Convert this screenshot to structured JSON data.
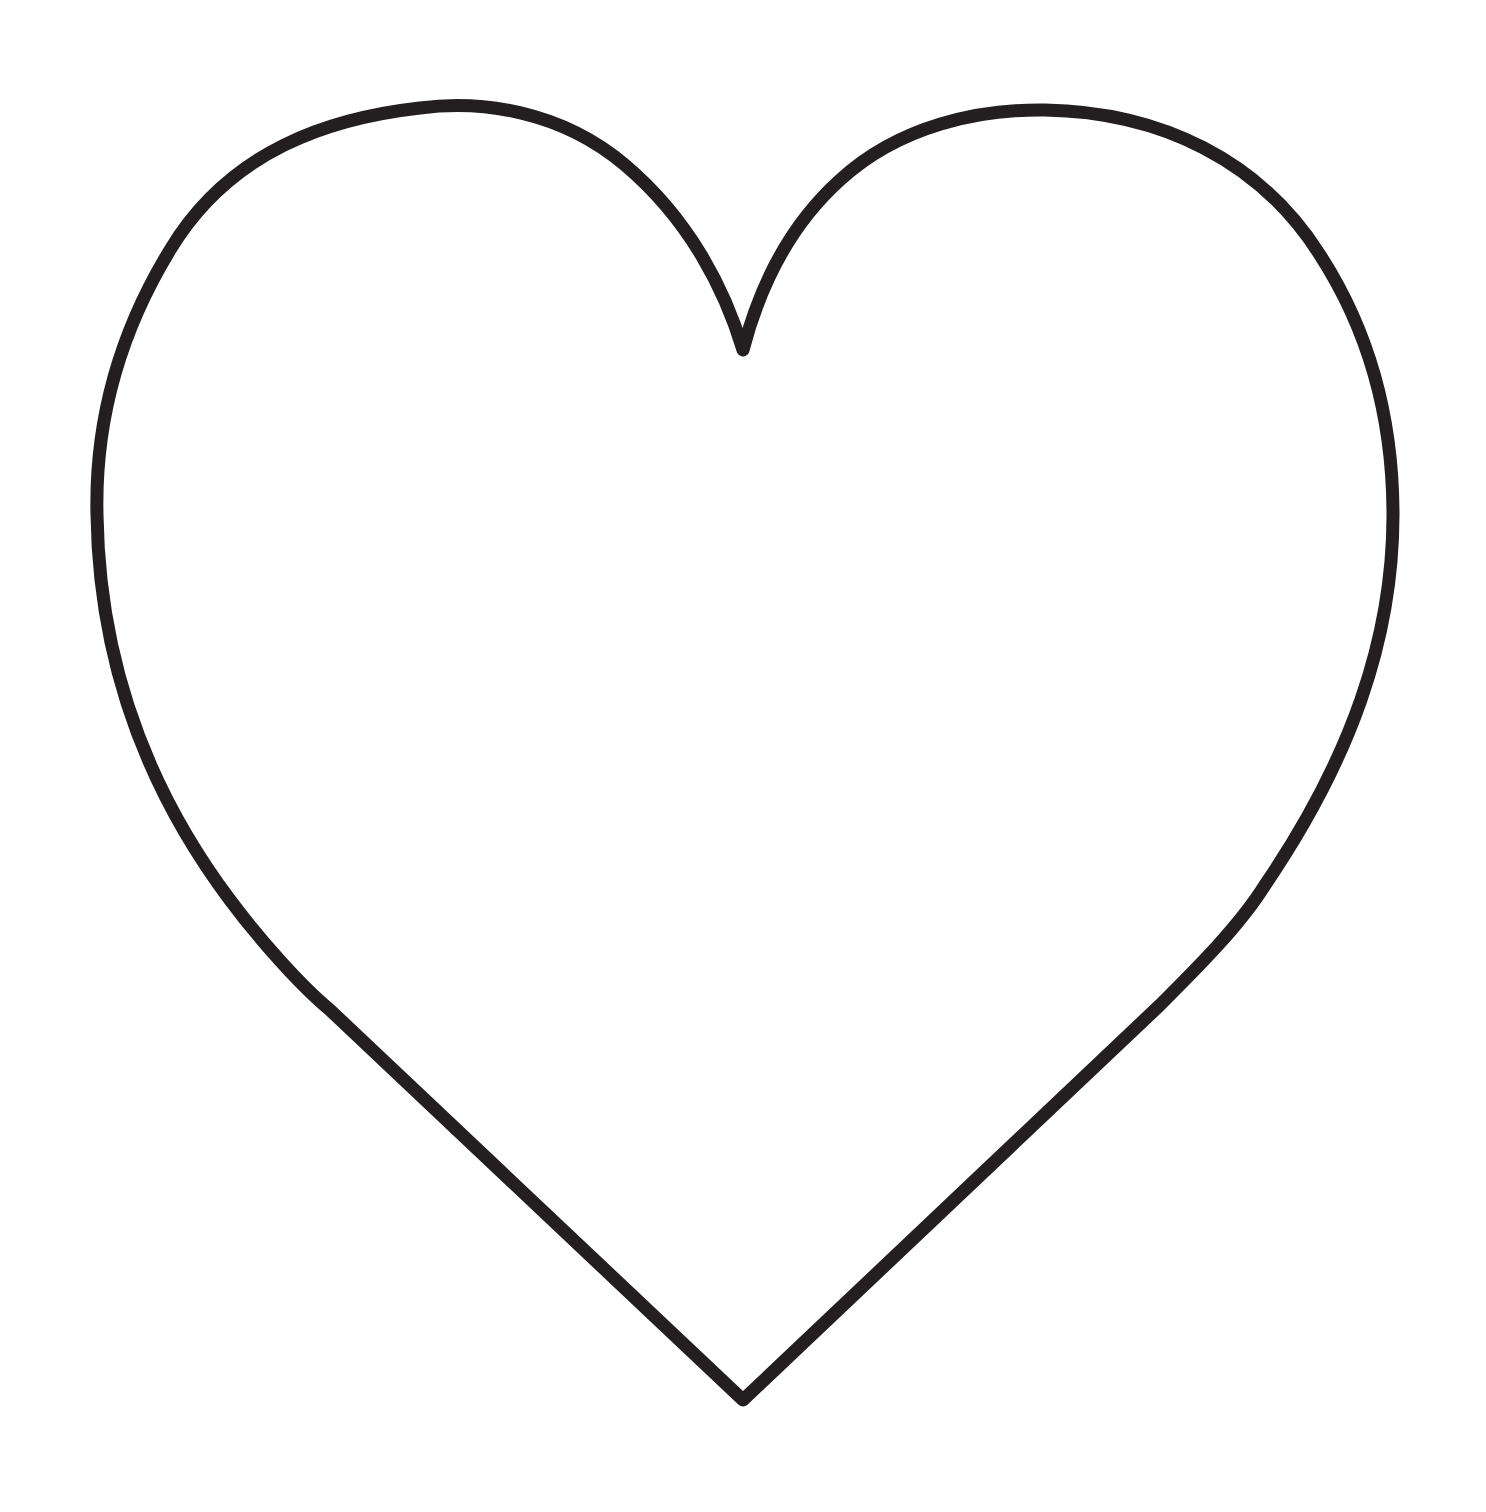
{
  "figure": {
    "shape": "heart-outline",
    "icon": "heart-icon",
    "stroke_color": "#231f20",
    "fill_color": "#ffffff",
    "background_color": "#ffffff"
  }
}
